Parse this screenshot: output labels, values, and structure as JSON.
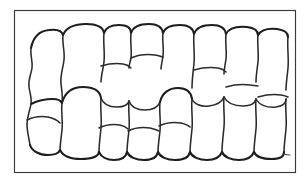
{
  "figure": {
    "type": "line-drawing",
    "background_color": "#ffffff",
    "frame": {
      "stroke_color": "#3a3a3a",
      "stroke_width": 1.15,
      "x": 14,
      "y": 10,
      "width": 281,
      "height": 162
    },
    "ink": {
      "primary_color": "#2b2b2b",
      "heavy_color": "#1e1e1e",
      "light_color": "#474747"
    },
    "cell_count": 21,
    "tiers": 2,
    "labels": [],
    "annotations": []
  }
}
